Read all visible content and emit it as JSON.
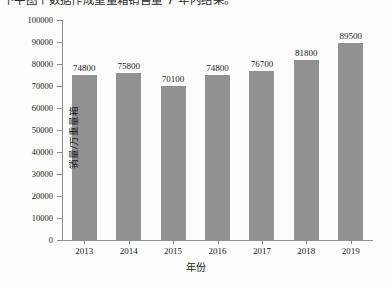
{
  "page": {
    "clipped_heading": "下平图个数据作成重量箱销售量 7 年内结果。"
  },
  "chart_data": {
    "type": "bar",
    "title": "",
    "categories": [
      "2013",
      "2014",
      "2015",
      "2016",
      "2017",
      "2018",
      "2019"
    ],
    "values": [
      74800,
      75800,
      70100,
      74800,
      76700,
      81800,
      89500
    ],
    "value_labels": [
      "74800",
      "75800",
      "70100",
      "74800",
      "76700",
      "81800",
      "89500"
    ],
    "xlabel": "年份",
    "ylabel": "销量/万重量箱",
    "ylim": [
      0,
      100000
    ],
    "ytick_step": 10000,
    "yticks": [
      0,
      10000,
      20000,
      30000,
      40000,
      50000,
      60000,
      70000,
      80000,
      90000,
      100000
    ],
    "ytick_labels": [
      "0",
      "10000",
      "20000",
      "30000",
      "40000",
      "50000",
      "60000",
      "70000",
      "80000",
      "90000",
      "100000"
    ],
    "grid": false,
    "legend": null,
    "bar_color": "#919191",
    "axis_color": "#8c8c8c",
    "background_color": "#fdfdfd"
  }
}
